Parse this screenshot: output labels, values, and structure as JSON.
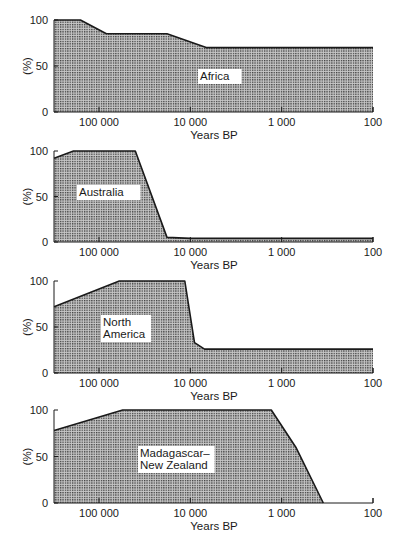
{
  "chart_data": [
    {
      "type": "area",
      "title": "Africa",
      "region_label": [
        "Africa"
      ],
      "xlabel": "Years BP",
      "ylabel": "(%)",
      "xscale": "log",
      "x_reversed": true,
      "xlim": [
        310000,
        100
      ],
      "ylim": [
        0,
        100
      ],
      "x_ticks": [
        100000,
        10000,
        1000,
        100
      ],
      "x_tick_labels": [
        "100 000",
        "10 000",
        "1 000",
        "100"
      ],
      "y_ticks": [
        0,
        50,
        100
      ],
      "y_tick_labels": [
        "0",
        "50",
        "100"
      ],
      "grid": false,
      "x": [
        310000,
        160000,
        83000,
        18000,
        6700,
        100
      ],
      "values": [
        100,
        100,
        85,
        85,
        70,
        70
      ]
    },
    {
      "type": "area",
      "title": "Australia",
      "region_label": [
        "Australia"
      ],
      "xlabel": "Years BP",
      "ylabel": "(%)",
      "xscale": "log",
      "x_reversed": true,
      "xlim": [
        310000,
        100
      ],
      "ylim": [
        0,
        100
      ],
      "x_ticks": [
        100000,
        10000,
        1000,
        100
      ],
      "x_tick_labels": [
        "100 000",
        "10 000",
        "1 000",
        "100"
      ],
      "y_ticks": [
        0,
        50,
        100
      ],
      "y_tick_labels": [
        "0",
        "50",
        "100"
      ],
      "grid": false,
      "x": [
        310000,
        190000,
        40000,
        18000,
        10000,
        100
      ],
      "values": [
        92,
        100,
        100,
        5,
        4,
        4
      ]
    },
    {
      "type": "area",
      "title": "North America",
      "region_label": [
        "North",
        "America"
      ],
      "xlabel": "Years BP",
      "ylabel": "(%)",
      "xscale": "log",
      "x_reversed": true,
      "xlim": [
        310000,
        100
      ],
      "ylim": [
        0,
        100
      ],
      "x_ticks": [
        100000,
        10000,
        1000,
        100
      ],
      "x_tick_labels": [
        "100 000",
        "10 000",
        "1 000",
        "100"
      ],
      "y_ticks": [
        0,
        50,
        100
      ],
      "y_tick_labels": [
        "0",
        "50",
        "100"
      ],
      "grid": false,
      "x": [
        310000,
        60000,
        11500,
        9000,
        7000,
        100
      ],
      "values": [
        72,
        100,
        100,
        33,
        26,
        26
      ]
    },
    {
      "type": "area",
      "title": "Madagascar–New Zealand",
      "region_label": [
        "Madagascar–",
        "New Zealand"
      ],
      "xlabel": "Years BP",
      "ylabel": "(%)",
      "xscale": "log",
      "x_reversed": true,
      "xlim": [
        310000,
        100
      ],
      "ylim": [
        0,
        100
      ],
      "x_ticks": [
        100000,
        10000,
        1000,
        100
      ],
      "x_tick_labels": [
        "100 000",
        "10 000",
        "1 000",
        "100"
      ],
      "y_ticks": [
        0,
        50,
        100
      ],
      "y_tick_labels": [
        "0",
        "50",
        "100"
      ],
      "grid": false,
      "x": [
        310000,
        55000,
        1300,
        700,
        350
      ],
      "values": [
        78,
        100,
        100,
        60,
        0
      ]
    }
  ],
  "panels": [
    {
      "label_lines": [
        "Africa"
      ],
      "label_x": 200,
      "label_y": 80
    },
    {
      "label_lines": [
        "Australia"
      ],
      "label_x": 79,
      "label_y": 196
    },
    {
      "label_lines": [
        "North",
        "America"
      ],
      "label_x": 103,
      "label_y": 326
    },
    {
      "label_lines": [
        "Madagascar–",
        "New Zealand"
      ],
      "label_x": 140,
      "label_y": 457
    }
  ],
  "style": {
    "fill_color": "#9a9a9a",
    "dot_color": "#3a3a3a",
    "line_color": "#1a1a1a"
  }
}
